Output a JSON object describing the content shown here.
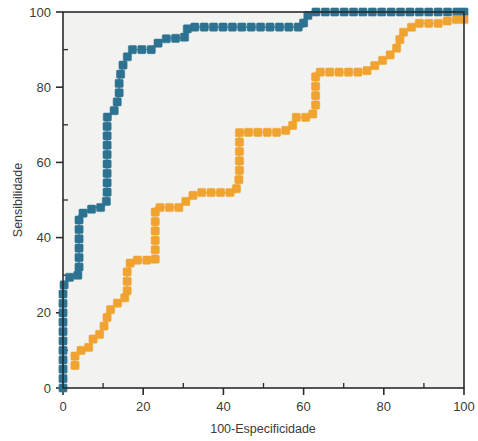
{
  "chart_data": {
    "type": "line",
    "title": "",
    "subtitle": "",
    "xlabel": "100-Especificidade",
    "ylabel": "Sensibilidade",
    "xlim": [
      0,
      100
    ],
    "ylim": [
      0,
      100
    ],
    "xticks": [
      0,
      20,
      40,
      60,
      80,
      100
    ],
    "yticks": [
      0,
      20,
      40,
      60,
      80,
      100
    ],
    "xtick_labels": [
      "0",
      "20",
      "40",
      "60",
      "80",
      "100"
    ],
    "ytick_labels": [
      "0",
      "20",
      "40",
      "60",
      "80",
      "100"
    ],
    "x_minor_tick_step": 10,
    "y_minor_tick_step": 10,
    "grid": false,
    "legend_position": "none",
    "marker": "square",
    "plot_background": "#f2f2f0",
    "frame_color": "#2b2b2b",
    "series": [
      {
        "name": "curve-blue",
        "color": "#2d7391",
        "marker_color": "#2d7391",
        "x": [
          0,
          0,
          0,
          0,
          0,
          0,
          0,
          0,
          0,
          2,
          4,
          4,
          4,
          4,
          4,
          8,
          10,
          11,
          11,
          11,
          11,
          11,
          11,
          11,
          11,
          11,
          11,
          13,
          14,
          14,
          15,
          17,
          19,
          21,
          22,
          24,
          26,
          28,
          30,
          31,
          31,
          33,
          35,
          38,
          41,
          44,
          47,
          50,
          53,
          56,
          59,
          60,
          60,
          62,
          65,
          68,
          71,
          74,
          77,
          80,
          83,
          86,
          89,
          92,
          95,
          98,
          100
        ],
        "y": [
          0,
          2,
          5,
          8,
          11,
          15,
          19,
          23,
          27,
          30,
          30,
          34,
          38,
          42,
          46,
          48,
          48,
          50,
          54,
          57,
          60,
          63,
          66,
          69,
          72,
          72,
          72,
          74,
          78,
          82,
          86,
          90,
          90,
          90,
          90,
          92,
          93,
          93,
          93,
          94,
          96,
          96,
          96,
          96,
          96,
          96,
          96,
          96,
          96,
          96,
          96,
          96,
          98,
          100,
          100,
          100,
          100,
          100,
          100,
          100,
          100,
          100,
          100,
          100,
          100,
          100,
          100
        ]
      },
      {
        "name": "curve-orange",
        "color": "#f0a32e",
        "marker_color": "#f0a32e",
        "x": [
          3,
          3,
          4,
          6,
          8,
          9,
          11,
          11,
          13,
          15,
          16,
          16,
          16,
          17,
          20,
          23,
          23,
          23,
          23,
          23,
          25,
          27,
          29,
          32,
          34,
          34,
          37,
          40,
          43,
          44,
          44,
          44,
          44,
          46,
          48,
          51,
          54,
          57,
          58,
          62,
          63,
          63,
          63,
          66,
          69,
          72,
          75,
          77,
          78,
          81,
          83,
          84,
          84,
          87,
          88,
          90,
          92,
          94,
          97,
          100
        ],
        "y": [
          6,
          9,
          10,
          10,
          14,
          14,
          18,
          20,
          22,
          24,
          24,
          28,
          31,
          34,
          34,
          34,
          38,
          42,
          45,
          48,
          48,
          48,
          48,
          51,
          52,
          52,
          52,
          52,
          52,
          56,
          60,
          64,
          68,
          68,
          68,
          68,
          68,
          69,
          72,
          72,
          75,
          79,
          84,
          84,
          84,
          84,
          84,
          85,
          86,
          88,
          90,
          92,
          94,
          96,
          97,
          97,
          97,
          97,
          98,
          98
        ]
      }
    ]
  }
}
